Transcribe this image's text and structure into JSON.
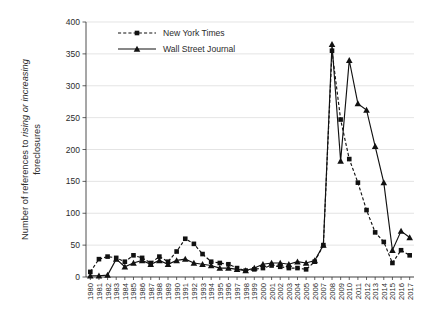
{
  "chart_data": {
    "type": "line",
    "title": "",
    "xlabel": "",
    "ylabel": "Number of references to rising or increasing foreclosures",
    "ylabel_parts": [
      {
        "text": "Number of references to ",
        "italic": false
      },
      {
        "text": "rising",
        "italic": true
      },
      {
        "text": " or ",
        "italic": false
      },
      {
        "text": "increasing",
        "italic": true
      },
      {
        "text": " foreclosures",
        "italic": false
      }
    ],
    "ylim": [
      0,
      400
    ],
    "ytick_step": 50,
    "yticks": [
      0,
      50,
      100,
      150,
      200,
      250,
      300,
      350,
      400
    ],
    "grid": true,
    "grid_axis": "y",
    "legend_position": "top-left-inside",
    "categories": [
      "1980",
      "1981",
      "1982",
      "1983",
      "1984",
      "1985",
      "1986",
      "1987",
      "1988",
      "1989",
      "1990",
      "1991",
      "1992",
      "1993",
      "1994",
      "1995",
      "1996",
      "1997",
      "1998",
      "1999",
      "2000",
      "2001",
      "2002",
      "2003",
      "2004",
      "2005",
      "2006",
      "2007",
      "2008",
      "2009",
      "2010",
      "2011",
      "2012",
      "2013",
      "2014",
      "2015",
      "2016",
      "2017"
    ],
    "series": [
      {
        "name": "New York Times",
        "marker": "square",
        "linestyle": "dashed",
        "color": "#111111",
        "values": [
          8,
          28,
          32,
          30,
          24,
          34,
          30,
          22,
          32,
          24,
          40,
          60,
          52,
          36,
          24,
          22,
          20,
          14,
          10,
          12,
          14,
          18,
          16,
          14,
          14,
          12,
          24,
          50,
          355,
          247,
          185,
          148,
          105,
          70,
          55,
          22,
          42,
          34
        ]
      },
      {
        "name": "Wall Street Journal",
        "marker": "triangle",
        "linestyle": "solid",
        "color": "#111111",
        "values": [
          2,
          2,
          3,
          28,
          16,
          22,
          26,
          20,
          26,
          20,
          26,
          28,
          22,
          20,
          18,
          14,
          14,
          12,
          10,
          14,
          20,
          22,
          22,
          20,
          24,
          22,
          26,
          50,
          365,
          182,
          340,
          272,
          262,
          205,
          148,
          42,
          72,
          62
        ]
      }
    ]
  },
  "legend": {
    "items": [
      {
        "label": "New York Times"
      },
      {
        "label": "Wall Street Journal"
      }
    ]
  }
}
